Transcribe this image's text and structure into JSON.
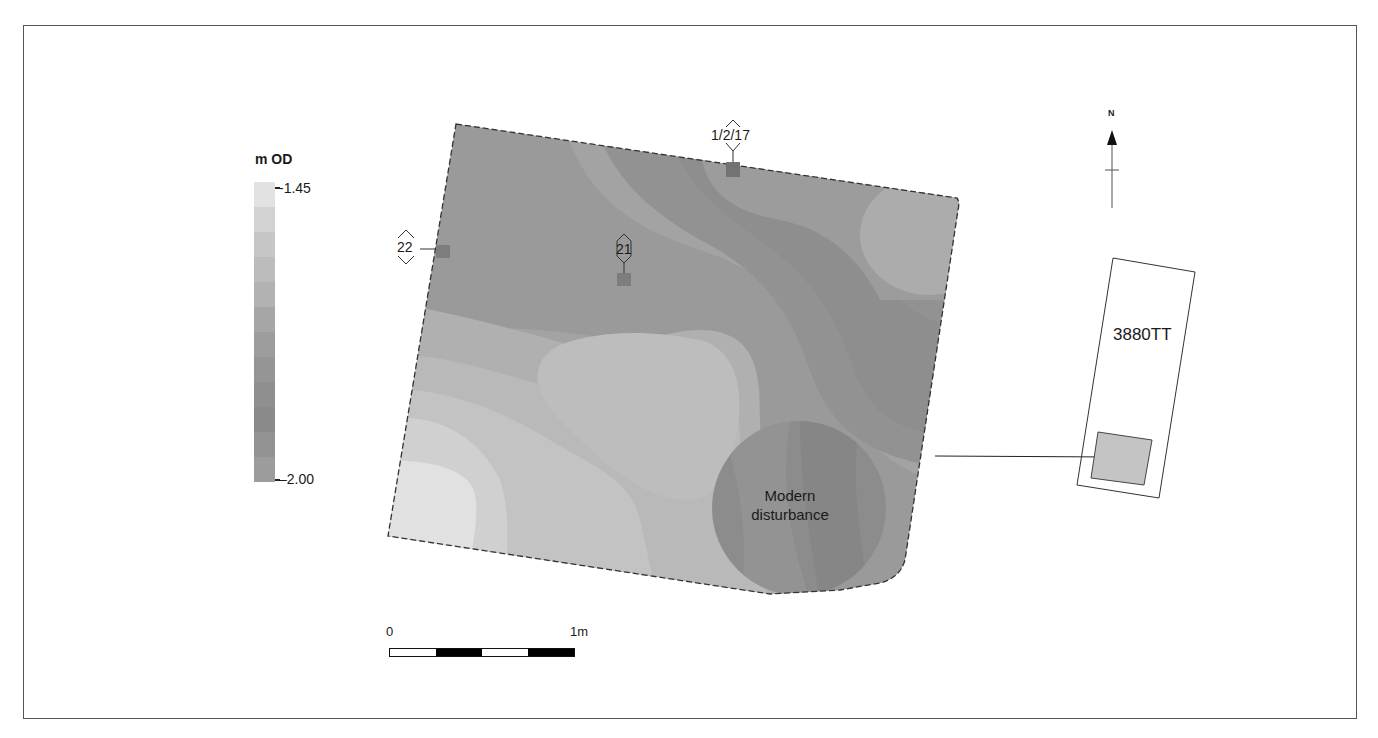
{
  "legend": {
    "title": "m OD",
    "max_label": "-1.45",
    "min_label": "–2.00",
    "bands": [
      "#e2e2e2",
      "#d2d2d2",
      "#c6c6c6",
      "#bcbcbc",
      "#b2b2b2",
      "#a6a6a6",
      "#9d9d9d",
      "#959595",
      "#8f8f8f",
      "#8a8a8a",
      "#939393",
      "#9c9c9c"
    ]
  },
  "map": {
    "points": [
      {
        "id": "22",
        "label": "22"
      },
      {
        "id": "21",
        "label": "21"
      },
      {
        "id": "1-2-17",
        "label": "1/2/17"
      }
    ],
    "disturbance_label_line1": "Modern",
    "disturbance_label_line2": "disturbance"
  },
  "scale": {
    "start_label": "0",
    "end_label": "1m"
  },
  "north_arrow": {
    "label": "N"
  },
  "location_inset": {
    "trench_label": "3880TT"
  },
  "colors": {
    "frame": "#555555",
    "inset_fill": "#c4c4c4"
  }
}
